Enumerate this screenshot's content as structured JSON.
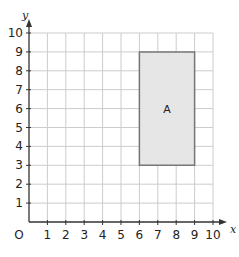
{
  "diagram": {
    "type": "coordinate-grid",
    "x_axis": {
      "label": "x",
      "min": 0,
      "max": 10,
      "ticks": [
        "1",
        "2",
        "3",
        "4",
        "5",
        "6",
        "7",
        "8",
        "9",
        "10"
      ]
    },
    "y_axis": {
      "label": "y",
      "min": 0,
      "max": 10,
      "ticks": [
        "1",
        "2",
        "3",
        "4",
        "5",
        "6",
        "7",
        "8",
        "9",
        "10"
      ]
    },
    "origin_label": "O",
    "shape": {
      "label": "A",
      "type": "rectangle",
      "vertices": [
        [
          6,
          3
        ],
        [
          9,
          3
        ],
        [
          9,
          9
        ],
        [
          6,
          9
        ]
      ],
      "fill": "#e6e6e6",
      "stroke": "#777777"
    },
    "colors": {
      "grid": "#cccccc",
      "axis": "#333333"
    }
  }
}
